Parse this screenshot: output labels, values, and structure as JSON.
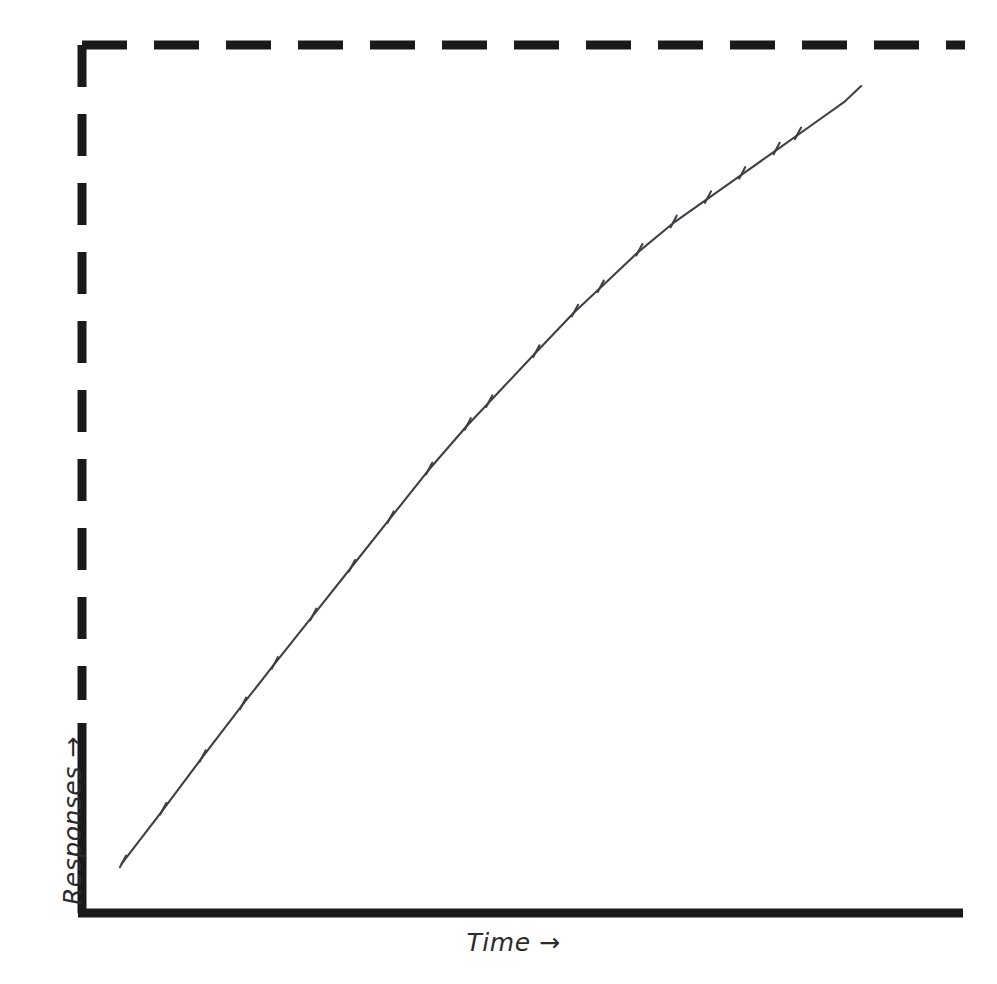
{
  "figure": {
    "background_color": "#ffffff",
    "ink_color": "#1a1a1a",
    "curve_color": "#3a3a3a"
  },
  "axes": {
    "x_label": "Time →",
    "y_label": "Responses →",
    "x_axis_name": "x-axis-solid-line",
    "y_axis_name": "y-axis-solid-line",
    "origin": [
      82,
      913
    ],
    "x_axis_end": [
      963,
      913
    ],
    "y_axis_top": [
      82,
      723
    ],
    "solid_axis_width": 9
  },
  "border": {
    "style": "dashed",
    "dash_length": 45,
    "gap_length": 27,
    "stroke_width": 9,
    "top_left": [
      82,
      45
    ],
    "top_right": [
      965,
      45
    ],
    "bottom_left": [
      82,
      700
    ]
  },
  "chart_data": {
    "type": "line",
    "title": "",
    "subtitle": "",
    "xlabel": "Time →",
    "ylabel": "Responses →",
    "xlim": [
      0,
      100
    ],
    "ylim": [
      0,
      100
    ],
    "grid": false,
    "legend": null,
    "annotations": [],
    "axis_tick_labels": {
      "x": [],
      "y": []
    },
    "series": [
      {
        "name": "Cumulative responses",
        "style": "solid-thin-line",
        "description": "Steady constant-rate cumulative record, nearly straight rising line",
        "x": [
          2.3,
          7.0,
          11.6,
          16.3,
          20.0,
          24.5,
          29.0,
          33.5,
          38.0,
          42.5,
          46.5,
          50.5,
          55.0,
          59.0,
          62.5,
          66.5,
          70.5,
          74.5,
          78.5,
          82.5,
          86.5,
          88.5
        ],
        "y": [
          3.0,
          9.5,
          16.0,
          22.5,
          27.5,
          33.5,
          39.5,
          45.5,
          51.5,
          57.0,
          61.5,
          66.0,
          71.0,
          75.0,
          78.5,
          82.0,
          85.0,
          88.0,
          91.0,
          94.0,
          97.0,
          99.0
        ]
      }
    ],
    "event_marks": {
      "name": "reinforcement-hatch-marks",
      "description": "Short hatch marks crossing the cumulative curve marking reinforcer deliveries",
      "count": 20,
      "t": [
        2.3,
        7.0,
        11.6,
        16.3,
        20.0,
        24.5,
        29.0,
        33.5,
        38.0,
        42.5,
        45.0,
        50.5,
        55.0,
        58.0,
        62.5,
        66.5,
        70.5,
        74.5,
        78.5,
        81.0
      ]
    }
  }
}
